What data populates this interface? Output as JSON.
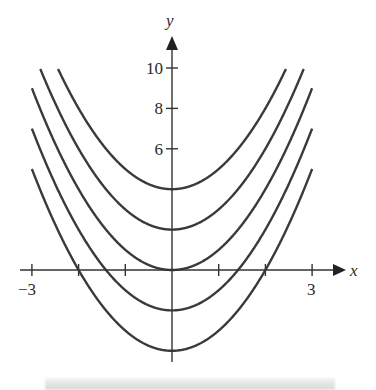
{
  "chart_data": {
    "type": "line",
    "title": "",
    "xlabel": "x",
    "ylabel": "y",
    "xlim": [
      -3,
      3
    ],
    "ylim": [
      -4,
      10
    ],
    "x_ticks": [
      -3,
      -2,
      -1,
      0,
      1,
      2,
      3
    ],
    "x_tick_labels": [
      {
        "value": -3,
        "label": "−3"
      },
      {
        "value": 3,
        "label": "3"
      }
    ],
    "y_ticks": [
      6,
      8,
      10
    ],
    "y_tick_labels": [
      {
        "value": 6,
        "label": "6"
      },
      {
        "value": 8,
        "label": "8"
      },
      {
        "value": 10,
        "label": "10"
      }
    ],
    "grid": false,
    "legend": null,
    "series": [
      {
        "name": "y = x^2 + 4",
        "C": 4
      },
      {
        "name": "y = x^2 + 2",
        "C": 2
      },
      {
        "name": "y = x^2",
        "C": 0
      },
      {
        "name": "y = x^2 - 2",
        "C": -2
      },
      {
        "name": "y = x^2 - 4",
        "C": -4
      }
    ],
    "line_color": "#3a3a3a"
  },
  "axes": {
    "x_label": "x",
    "y_label": "y"
  }
}
